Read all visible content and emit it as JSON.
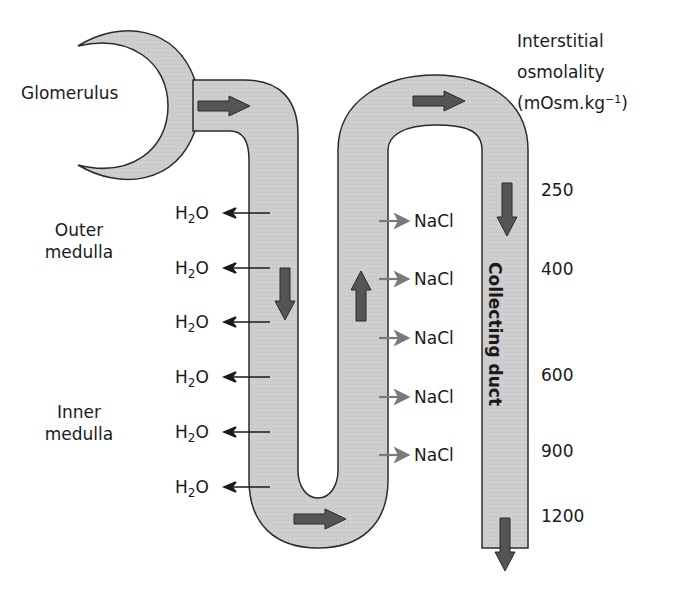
{
  "labels": {
    "glomerulus": "Glomerulus",
    "outer_medulla": [
      "Outer",
      "medulla"
    ],
    "inner_medulla": [
      "Inner",
      "medulla"
    ],
    "interstitial_title": [
      "Interstitial",
      "osmolality"
    ],
    "units_prefix": "(mOsm.kg",
    "units_sup": "−1",
    "units_suffix": ")",
    "collecting_duct": "Collecting duct"
  },
  "water_efflux": {
    "label_base": "H",
    "label_sub": "2",
    "label_tail": "O",
    "count": 6
  },
  "salt_efflux": {
    "label": "NaCl",
    "count": 5
  },
  "osmolality_scale": [
    "250",
    "400",
    "600",
    "900",
    "1200"
  ],
  "colors": {
    "tubule_fill": "#cfcfcf",
    "tubule_stroke": "#2b2b2b",
    "flow_arrow": "#555555",
    "water_arrow": "#1a1a1a",
    "salt_arrow": "#7a7a7a"
  }
}
